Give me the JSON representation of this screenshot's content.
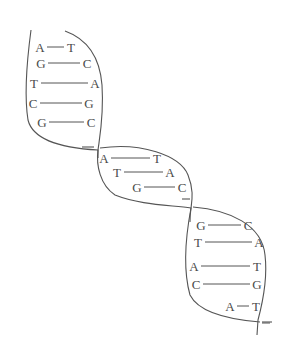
{
  "diagram": {
    "colors": {
      "line": "#555555",
      "text": "#4a4a4a",
      "background": "#ffffff"
    },
    "sections": [
      {
        "pairs": [
          {
            "left": "A",
            "right": "T",
            "lx": 40,
            "rx": 71,
            "y": 47
          },
          {
            "left": "G",
            "right": "C",
            "lx": 41,
            "rx": 87,
            "y": 63
          },
          {
            "left": "T",
            "right": "A",
            "lx": 34,
            "rx": 95,
            "y": 83
          },
          {
            "left": "C",
            "right": "G",
            "lx": 33,
            "rx": 89,
            "y": 103
          },
          {
            "left": "G",
            "right": "C",
            "lx": 42,
            "rx": 91,
            "y": 122
          }
        ]
      },
      {
        "pairs": [
          {
            "left": "A",
            "right": "T",
            "lx": 104,
            "rx": 157,
            "y": 158
          },
          {
            "left": "T",
            "right": "A",
            "lx": 117,
            "rx": 170,
            "y": 172
          },
          {
            "left": "G",
            "right": "C",
            "lx": 137,
            "rx": 182,
            "y": 187
          }
        ]
      },
      {
        "pairs": [
          {
            "left": "G",
            "right": "C",
            "lx": 201,
            "rx": 248,
            "y": 225
          },
          {
            "left": "T",
            "right": "A",
            "lx": 198,
            "rx": 259,
            "y": 242
          },
          {
            "left": "A",
            "right": "T",
            "lx": 194,
            "rx": 257,
            "y": 266
          },
          {
            "left": "C",
            "right": "G",
            "lx": 196,
            "rx": 257,
            "y": 284
          },
          {
            "left": "A",
            "right": "T",
            "lx": 230,
            "rx": 256,
            "y": 306
          }
        ]
      }
    ]
  }
}
